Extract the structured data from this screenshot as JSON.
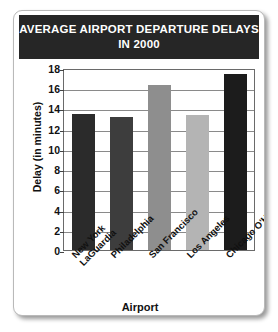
{
  "chart_data": {
    "type": "bar",
    "title": "AVERAGE AIRPORT DEPARTURE DELAYS IN 2000",
    "title_line1": "AVERAGE AIRPORT DEPARTURE DELAYS",
    "title_line2": "IN 2000",
    "xlabel": "Airport",
    "ylabel": "Delay (in minutes)",
    "categories": [
      "New York LaGuardia",
      "Philadelphia",
      "San Francisco",
      "Los Angeles",
      "Chicago O'Hare"
    ],
    "category_lines": [
      [
        "New York",
        "LaGuardia"
      ],
      [
        "Philadelphia"
      ],
      [
        "San Francisco"
      ],
      [
        "Los Angeles"
      ],
      [
        "Chicago O'Hare"
      ]
    ],
    "values": [
      13.5,
      13.2,
      16.3,
      13.4,
      17.4
    ],
    "bar_colors": [
      "#2b2b2b",
      "#3d3d3d",
      "#8e8e8e",
      "#b4b4b4",
      "#1c1c1c"
    ],
    "ylim": [
      0,
      18
    ],
    "yticks": [
      0,
      2,
      4,
      6,
      8,
      10,
      12,
      14,
      16,
      18
    ],
    "grid": true,
    "legend": null
  },
  "colors": {
    "title_bar_background": "#262626",
    "title_text": "#ffffff",
    "card_background": "#ffffff",
    "axis_line": "#6a6a6a",
    "gridline": "#8a8a8a"
  }
}
